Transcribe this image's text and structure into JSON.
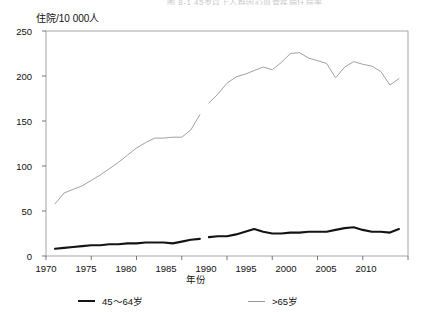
{
  "partial_title": "图 8-1 45岁以上人群因心血管疾病住院率",
  "axes": {
    "y_title": "住院/10 000人",
    "x_title": "年份",
    "y_ticks": [
      "0",
      "50",
      "100",
      "150",
      "200",
      "250"
    ],
    "x_ticks": [
      "1970",
      "1975",
      "1980",
      "1985",
      "1990",
      "1995",
      "2000",
      "2005",
      "2010"
    ]
  },
  "legend": {
    "items": [
      {
        "label": "45～64岁",
        "color": "#141414",
        "style": "thick"
      },
      {
        "label": ">65岁",
        "color": "#9b9b9b",
        "style": "thin"
      }
    ]
  },
  "chart_data": {
    "type": "line",
    "title": "图 8-1 45岁以上人群因心血管疾病住院率",
    "xlabel": "年份",
    "ylabel": "住院/10 000人",
    "xlim": [
      1970,
      2010
    ],
    "ylim": [
      0,
      250
    ],
    "grid": false,
    "legend_position": "bottom",
    "series": [
      {
        "name": "45～64岁",
        "color": "#141414",
        "segment": 1,
        "x": [
          1971,
          1972,
          1973,
          1974,
          1975,
          1976,
          1977,
          1978,
          1979,
          1980,
          1981,
          1982,
          1983,
          1984,
          1985,
          1986,
          1987
        ],
        "values": [
          8,
          9,
          10,
          11,
          12,
          12,
          13,
          13,
          14,
          14,
          15,
          15,
          15,
          14,
          16,
          18,
          19
        ]
      },
      {
        "name": "45～64岁",
        "color": "#141414",
        "segment": 2,
        "x": [
          1988,
          1989,
          1990,
          1991,
          1992,
          1993,
          1994,
          1995,
          1996,
          1997,
          1998,
          1999,
          2000,
          2001,
          2002,
          2003,
          2004,
          2005,
          2006,
          2007,
          2008,
          2009
        ],
        "values": [
          21,
          22,
          22,
          24,
          27,
          30,
          27,
          25,
          25,
          26,
          26,
          27,
          27,
          27,
          29,
          31,
          32,
          29,
          27,
          27,
          26,
          30
        ]
      },
      {
        "name": ">65岁",
        "color": "#9b9b9b",
        "segment": 1,
        "x": [
          1971,
          1972,
          1973,
          1974,
          1975,
          1976,
          1977,
          1978,
          1979,
          1980,
          1981,
          1982,
          1983,
          1984,
          1985,
          1986,
          1987
        ],
        "values": [
          58,
          70,
          74,
          78,
          84,
          90,
          97,
          104,
          112,
          120,
          126,
          131,
          131,
          132,
          132,
          140,
          157
        ]
      },
      {
        "name": ">65岁",
        "color": "#9b9b9b",
        "segment": 2,
        "x": [
          1988,
          1989,
          1990,
          1991,
          1992,
          1993,
          1994,
          1995,
          1996,
          1997,
          1998,
          1999,
          2000,
          2001,
          2002,
          2003,
          2004,
          2005,
          2006,
          2007,
          2008,
          2009
        ],
        "values": [
          170,
          180,
          192,
          199,
          202,
          206,
          210,
          207,
          215,
          225,
          226,
          220,
          217,
          214,
          198,
          210,
          216,
          213,
          211,
          205,
          190,
          197
        ]
      }
    ]
  }
}
